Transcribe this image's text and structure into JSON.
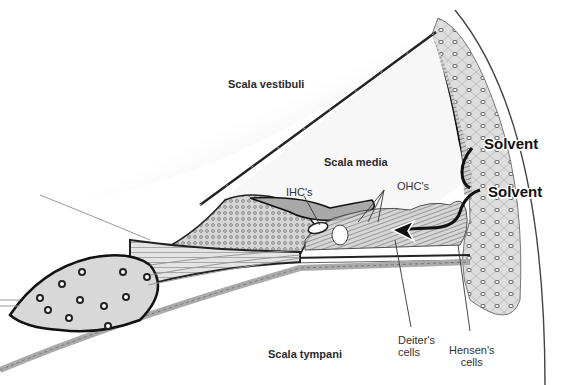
{
  "diagram": {
    "labels": {
      "scala_vestibuli": "Scala vestibuli",
      "scala_media": "Scala media",
      "scala_tympani": "Scala tympani",
      "ihc": "IHC's",
      "ohc": "OHC's",
      "solvent_top": "Solvent",
      "solvent_bottom": "Solvent",
      "deiters_line1": "Deiter's",
      "deiters_line2": "cells",
      "hensens_line1": "Hensen's",
      "hensens_line2": "cells"
    },
    "colors": {
      "background": "#ffffff",
      "membrane": "#1a1a1a",
      "tissue_fill": "#d9d9d9",
      "cell_fill": "#bdbdbd",
      "shade": "#e6e6e6"
    }
  }
}
